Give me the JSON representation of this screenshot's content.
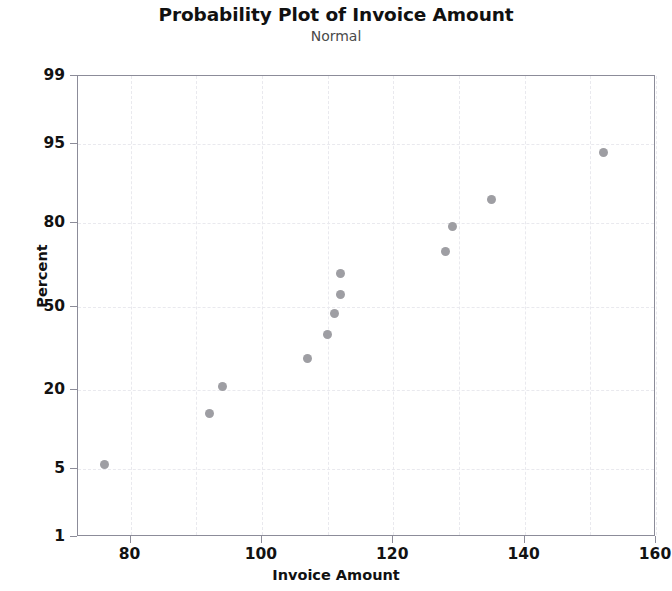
{
  "chart_data": {
    "type": "scatter",
    "title": "Probability Plot of Invoice Amount",
    "subtitle": "Normal",
    "xlabel": "Invoice Amount",
    "ylabel": "Percent",
    "xlim": [
      72,
      160
    ],
    "ylim": [
      1,
      99
    ],
    "yscale": "normal-probability",
    "grid": true,
    "legend": false,
    "xticks": [
      80,
      100,
      120,
      140,
      160
    ],
    "yticks": [
      99,
      95,
      80,
      50,
      20,
      5,
      1
    ],
    "xticklabels": [
      "80",
      "100",
      "120",
      "140",
      "160"
    ],
    "yticklabels": [
      "99",
      "95",
      "80",
      "50",
      "20",
      "5",
      "1"
    ],
    "x_minor_step": 10,
    "series": [
      {
        "name": "Invoice Amount",
        "marker": "circle",
        "color": "#9e9ea3",
        "x": [
          76,
          92,
          94,
          107,
          110,
          111,
          112,
          112,
          128,
          129,
          135,
          152
        ],
        "y": [
          5.5,
          14,
          21,
          30,
          39,
          47,
          55,
          63,
          71,
          79,
          86,
          94
        ]
      }
    ],
    "points": [
      {
        "x": 76,
        "y": 5.5
      },
      {
        "x": 92,
        "y": 14
      },
      {
        "x": 94,
        "y": 21
      },
      {
        "x": 107,
        "y": 30
      },
      {
        "x": 110,
        "y": 39
      },
      {
        "x": 111,
        "y": 47
      },
      {
        "x": 112,
        "y": 55
      },
      {
        "x": 112,
        "y": 63
      },
      {
        "x": 128,
        "y": 71
      },
      {
        "x": 129,
        "y": 79
      },
      {
        "x": 135,
        "y": 86
      },
      {
        "x": 152,
        "y": 94
      }
    ]
  },
  "colors": {
    "marker": "#9e9ea3",
    "axis": "#8c8c99",
    "grid": "#e9e9ee",
    "title": "#111111",
    "subtitle": "#4a4a4a",
    "background": "#ffffff"
  }
}
